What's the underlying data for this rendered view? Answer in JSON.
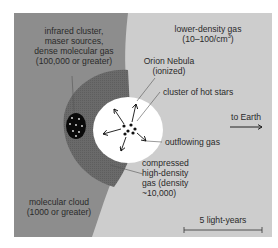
{
  "diagram": {
    "title": "",
    "colors": {
      "background": "#ffffff",
      "molecular_cloud": "#8d8d8d",
      "compressed_gas": "#6a6a6a",
      "lower_density_gas": "#cdcdcd",
      "nebula": "#ffffff",
      "infrared_cluster": "#0a0a0a",
      "text": "#2a2a2a"
    },
    "regions": [
      {
        "id": "molecular-cloud",
        "label": "molecular cloud",
        "density": "(1000 or greater)"
      },
      {
        "id": "lower-density-gas",
        "label": "lower-density gas",
        "density": "(10–100/cm³)"
      },
      {
        "id": "compressed-gas",
        "label": "compressed high-density gas (density ~10,000)"
      },
      {
        "id": "orion-nebula",
        "label": "Orion Nebula (ionized)"
      },
      {
        "id": "infrared-cluster",
        "label": "infrared cluster, maser sources, dense molecular gas (100,000 or greater)"
      }
    ],
    "labels": {
      "infrared_line1": "infrared cluster,",
      "infrared_line2": "maser sources,",
      "infrared_line3": "dense molecular gas",
      "infrared_line4": "(100,000 or greater)",
      "lower_density_line1": "lower-density gas",
      "lower_density_line2_pre": "(10–100/cm",
      "lower_density_line2_sup": "3",
      "lower_density_line2_post": ")",
      "orion_line1": "Orion Nebula",
      "orion_line2": "(ionized)",
      "hot_stars": "cluster of hot stars",
      "to_earth": "to Earth",
      "outflowing_gas": "outflowing gas",
      "compressed_line1": "compressed",
      "compressed_line2": "high-density",
      "compressed_line3": "gas (density",
      "compressed_line4": "~10,000)",
      "molecular_line1": "molecular cloud",
      "molecular_line2": "(1000 or greater)",
      "scale_bar": "5 light-years"
    }
  }
}
